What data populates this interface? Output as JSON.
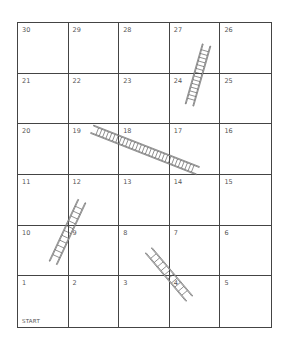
{
  "board": {
    "rows": [
      [
        "30",
        "29",
        "28",
        "27",
        "26"
      ],
      [
        "21",
        "22",
        "23",
        "24",
        "25"
      ],
      [
        "20",
        "19",
        "18",
        "17",
        "16"
      ],
      [
        "11",
        "12",
        "13",
        "14",
        "15"
      ],
      [
        "10",
        "9",
        "8",
        "7",
        "6"
      ],
      [
        "1",
        "2",
        "3",
        "4",
        "5"
      ]
    ],
    "start_label": "START",
    "line_color": "#444444"
  },
  "ladders": [
    {
      "id": "ladder-24-27",
      "x1": 190,
      "y1": 103,
      "x2": 206,
      "y2": 47,
      "rungs": 14
    },
    {
      "id": "ladder-19-14",
      "x1": 94,
      "y1": 130,
      "x2": 196,
      "y2": 170,
      "rungs": 30
    },
    {
      "id": "ladder-10-12",
      "x1": 54,
      "y1": 261,
      "x2": 81,
      "y2": 203,
      "rungs": 11
    },
    {
      "id": "ladder-8-4",
      "x1": 150,
      "y1": 252,
      "x2": 188,
      "y2": 297,
      "rungs": 10
    }
  ]
}
